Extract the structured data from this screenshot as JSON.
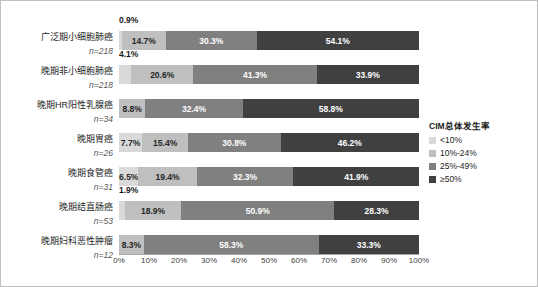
{
  "chart_data": {
    "type": "bar",
    "subtype": "stacked-horizontal-100",
    "title": "",
    "xlabel": "",
    "ylabel": "",
    "xlim": [
      0,
      100
    ],
    "grid": false,
    "legend_position": "right",
    "legend_title": "CIM总体发生率",
    "categories": [
      "广泛期小细胞肺癌",
      "晚期非小细胞肺癌",
      "晚期HR阳性乳腺癌",
      "晚期胃癌",
      "晚期食管癌",
      "晚期结直肠癌",
      "晚期妇科恶性肿瘤"
    ],
    "category_counts": [
      "n=218",
      "n=218",
      "n=34",
      "n=26",
      "n=31",
      "n=53",
      "n=12"
    ],
    "series": [
      {
        "name": "<10%",
        "color": "#d9d9d9",
        "values": [
          0.9,
          4.1,
          0,
          7.7,
          6.5,
          1.9,
          0
        ]
      },
      {
        "name": "10%-24%",
        "color": "#bfbfbf",
        "values": [
          14.7,
          20.6,
          8.8,
          15.4,
          19.4,
          18.9,
          8.3
        ]
      },
      {
        "name": "25%-49%",
        "color": "#808080",
        "values": [
          30.3,
          41.3,
          32.4,
          30.8,
          32.3,
          50.9,
          58.3
        ]
      },
      {
        "name": "≥50%",
        "color": "#404040",
        "values": [
          54.1,
          33.9,
          58.8,
          46.2,
          41.9,
          28.3,
          33.3
        ]
      }
    ],
    "value_labels": [
      [
        "0.9%",
        "14.7%",
        "30.3%",
        "54.1%"
      ],
      [
        "4.1%",
        "20.6%",
        "41.3%",
        "33.9%"
      ],
      [
        "",
        "8.8%",
        "32.4%",
        "58.8%"
      ],
      [
        "7.7%",
        "15.4%",
        "30.8%",
        "46.2%"
      ],
      [
        "6.5%",
        "19.4%",
        "32.3%",
        "41.9%"
      ],
      [
        "1.9%",
        "18.9%",
        "50.9%",
        "28.3%"
      ],
      [
        "",
        "8.3%",
        "58.3%",
        "33.3%"
      ]
    ],
    "xticks": [
      "0%",
      "10%",
      "20%",
      "30%",
      "40%",
      "50%",
      "60%",
      "70%",
      "80%",
      "90%",
      "100%"
    ],
    "xtick_values": [
      0,
      10,
      20,
      30,
      40,
      50,
      60,
      70,
      80,
      90,
      100
    ]
  },
  "legend": {
    "title": "CIM总体发生率",
    "items": [
      {
        "label": "<10%",
        "color": "#d9d9d9"
      },
      {
        "label": "10%-24%",
        "color": "#bfbfbf"
      },
      {
        "label": "25%-49%",
        "color": "#808080"
      },
      {
        "label": "≥50%",
        "color": "#404040"
      }
    ]
  }
}
